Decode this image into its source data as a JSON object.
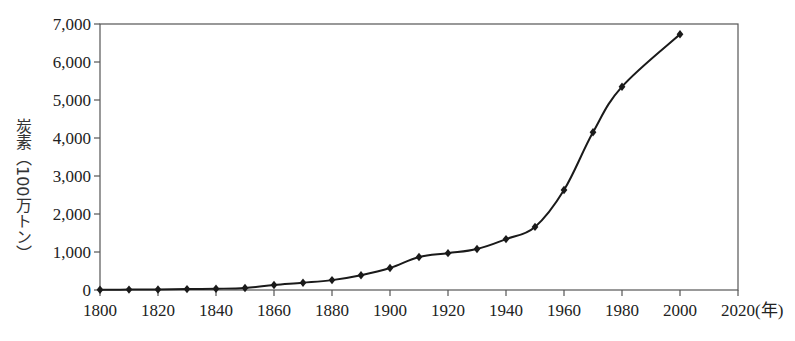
{
  "chart_data": {
    "type": "line",
    "title": "",
    "xlabel": "(年)",
    "ylabel": "炭素（100万トン）",
    "x": [
      1800,
      1810,
      1820,
      1830,
      1840,
      1850,
      1860,
      1870,
      1880,
      1890,
      1900,
      1910,
      1920,
      1930,
      1940,
      1950,
      1960,
      1970,
      1980,
      2000
    ],
    "series": [
      {
        "name": "炭素排出量",
        "values": [
          8,
          10,
          14,
          24,
          33,
          54,
          130,
          190,
          260,
          390,
          580,
          870,
          970,
          1080,
          1340,
          1660,
          2630,
          4150,
          5350,
          6730
        ]
      }
    ],
    "xlim": [
      1800,
      2020
    ],
    "ylim": [
      0,
      7000
    ],
    "xticks": [
      1800,
      1820,
      1840,
      1860,
      1880,
      1900,
      1920,
      1940,
      1960,
      1980,
      2000,
      2020
    ],
    "yticks": [
      0,
      1000,
      2000,
      3000,
      4000,
      5000,
      6000,
      7000
    ],
    "ytick_labels": [
      "0",
      "1,000",
      "2,000",
      "3,000",
      "4,000",
      "5,000",
      "6,000",
      "7,000"
    ],
    "xtick_labels": [
      "1800",
      "1820",
      "1840",
      "1860",
      "1880",
      "1900",
      "1920",
      "1940",
      "1960",
      "1980",
      "2000",
      "2020(年)"
    ],
    "grid": false,
    "legend": null,
    "marker": "diamond",
    "line_color": "#1a1a1a"
  }
}
